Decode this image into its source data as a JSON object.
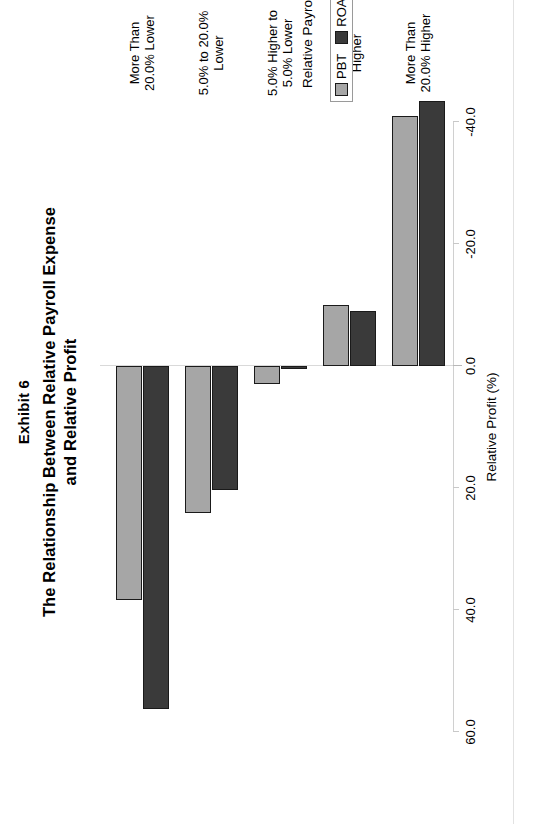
{
  "figure": {
    "exhibit_label": "Exhibit 6",
    "title_line1": "The Relationship Between Relative Payroll Expense",
    "title_line2": "and Relative Profit"
  },
  "legend": {
    "position": "bottom-right",
    "items": [
      {
        "label": "PBT",
        "color": "#a6a6a6"
      },
      {
        "label": "ROA",
        "color": "#3a3a3a"
      }
    ]
  },
  "axes": {
    "value_axis_title": "Relative Profit (%)",
    "category_axis_title": "Relative Payroll",
    "value_ticks": [
      "60.0",
      "40.0",
      "20.0",
      "0.0",
      "-20.0",
      "-40.0"
    ]
  },
  "categories_display": [
    {
      "line1": "More Than",
      "line2": "20.0% Lower"
    },
    {
      "line1": "5.0% to 20.0%",
      "line2": "Lower"
    },
    {
      "line1": "5.0% Higher to",
      "line2": "5.0% Lower"
    },
    {
      "line1": "5.0% to 20.0%",
      "line2": "Higher"
    },
    {
      "line1": "More Than",
      "line2": "20.0% Higher"
    }
  ],
  "chart_data": {
    "type": "bar",
    "orientation": "vertical-rendered-rotated",
    "title": "The Relationship Between Relative Payroll Expense and Relative Profit",
    "subtitle": "Exhibit 6",
    "xlabel": "Relative Payroll",
    "ylabel": "Relative Profit (%)",
    "ylim": [
      -40.0,
      60.0
    ],
    "ytick_values": [
      60.0,
      40.0,
      20.0,
      0.0,
      -20.0,
      -40.0
    ],
    "grid": false,
    "legend": [
      "PBT",
      "ROA"
    ],
    "categories": [
      "More Than 20.0% Lower",
      "5.0% to 20.0% Lower",
      "5.0% Higher to 5.0% Lower",
      "5.0% to 20.0% Higher",
      "More Than 20.0% Higher"
    ],
    "series": [
      {
        "name": "PBT",
        "color": "#a6a6a6",
        "values": [
          38.3,
          24.1,
          3.0,
          -10.0,
          -41.0
        ]
      },
      {
        "name": "ROA",
        "color": "#3a3a3a",
        "values": [
          56.3,
          20.4,
          0.5,
          -9.0,
          -43.5
        ]
      }
    ]
  }
}
